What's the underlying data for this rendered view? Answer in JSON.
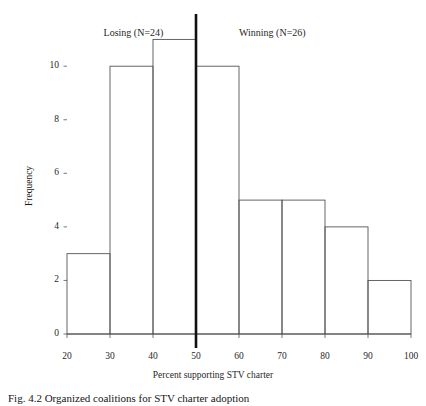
{
  "figure": {
    "caption": "Fig. 4.2 Organized coalitions for STV charter adoption",
    "background_color": "#ffffff",
    "bar_stroke_color": "#555555",
    "axis_color": "#555555",
    "divider_color": "#111111"
  },
  "annotations": {
    "left_group": "Losing (N=24)",
    "right_group": "Winning (N=26)"
  },
  "chart_data": {
    "type": "bar",
    "title": "",
    "subtitle": "",
    "xlabel": "Percent supporting STV charter",
    "ylabel": "Frequency",
    "categories": [
      "20-30",
      "30-40",
      "40-50",
      "50-60",
      "60-70",
      "70-80",
      "80-90",
      "90-100"
    ],
    "bin_edges": [
      20,
      30,
      40,
      50,
      60,
      70,
      80,
      90,
      100
    ],
    "values": [
      3,
      10,
      11,
      10,
      5,
      5,
      4,
      2
    ],
    "xlim": [
      20,
      100
    ],
    "ylim": [
      0,
      11.8
    ],
    "xticks": [
      20,
      30,
      40,
      50,
      60,
      70,
      80,
      90,
      100
    ],
    "xtick_labels": [
      "20",
      "30",
      "40",
      "50",
      "60",
      "70",
      "80",
      "90",
      "100"
    ],
    "yticks": [
      0,
      2,
      4,
      6,
      8,
      10
    ],
    "ytick_labels": [
      "0",
      "2",
      "4",
      "6",
      "8",
      "10"
    ],
    "grid": false,
    "legend": "none",
    "reference_line": {
      "x": 50,
      "label": "",
      "style": "solid-thick"
    },
    "annotations": [
      {
        "text": "Losing (N=24)",
        "x": 35,
        "y": 11.4
      },
      {
        "text": "Winning (N=26)",
        "x": 72,
        "y": 11.4
      }
    ]
  }
}
